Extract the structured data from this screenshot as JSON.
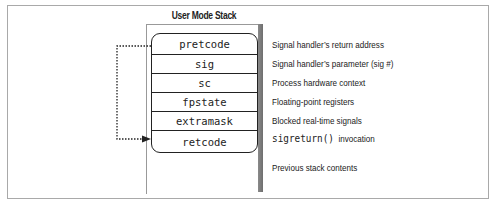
{
  "diagram": {
    "title": "User Mode Stack",
    "stack_cells": [
      {
        "label": "pretcode",
        "description": "Signal handler’s return address"
      },
      {
        "label": "sig",
        "description": "Signal handler’s parameter (sig #)"
      },
      {
        "label": "sc",
        "description": "Process hardware context"
      },
      {
        "label": "fpstate",
        "description": "Floating-point registers"
      },
      {
        "label": "extramask",
        "description": "Blocked real-time signals"
      },
      {
        "label": "retcode",
        "description_code": "sigreturn()",
        "description": "invocation"
      }
    ],
    "below_stack": "Previous stack contents",
    "arrow": {
      "from": "pretcode",
      "to": "retcode",
      "style": "dotted"
    },
    "colors": {
      "line": "#222222",
      "frame": "#a9a9a9",
      "column_bar": "#7a7a7a"
    }
  }
}
